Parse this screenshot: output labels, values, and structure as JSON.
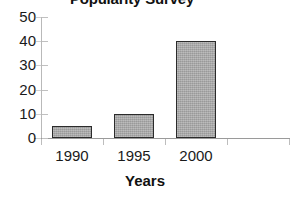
{
  "chart_data": {
    "type": "bar",
    "title": "Popularity Survey",
    "xlabel": "Years",
    "ylabel": "",
    "categories": [
      "1990",
      "1995",
      "2000",
      ""
    ],
    "values": [
      5,
      10,
      40,
      null
    ],
    "ylim": [
      0,
      50
    ],
    "yticks": [
      "0",
      "10",
      "20",
      "30",
      "40",
      "50"
    ],
    "grid": false,
    "legend": false,
    "bar_fill_color": "#a8a8a8",
    "bar_border_color": "#2b2b2b",
    "axis_color": "#9a9a9a",
    "text_color": "#1a1a1a"
  }
}
